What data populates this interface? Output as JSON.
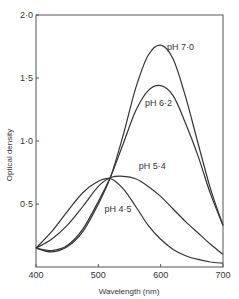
{
  "chart_data": {
    "type": "line",
    "title": "",
    "xlabel": "Wavelength (nm)",
    "ylabel": "Optical density",
    "xlim": [
      400,
      700
    ],
    "ylim": [
      0,
      2.0
    ],
    "x_ticks": [
      400,
      500,
      600,
      700
    ],
    "x_tick_labels": [
      "400",
      "500",
      "600",
      "700"
    ],
    "y_ticks": [
      0.5,
      1.0,
      1.5,
      2.0
    ],
    "y_tick_labels": [
      "0·5",
      "1·0",
      "1·5",
      "2·0"
    ],
    "grid": false,
    "legend": "inline labels",
    "x": [
      400,
      425,
      450,
      475,
      500,
      520,
      540,
      560,
      580,
      600,
      620,
      640,
      660,
      680,
      700
    ],
    "series": [
      {
        "name": "pH 7·0",
        "label": "pH 7·0",
        "values": [
          0.15,
          0.12,
          0.16,
          0.28,
          0.5,
          0.72,
          1.05,
          1.42,
          1.68,
          1.76,
          1.65,
          1.35,
          0.98,
          0.62,
          0.33
        ]
      },
      {
        "name": "pH 6·2",
        "label": "pH 6·2",
        "values": [
          0.15,
          0.13,
          0.17,
          0.3,
          0.52,
          0.72,
          0.98,
          1.24,
          1.4,
          1.44,
          1.36,
          1.14,
          0.88,
          0.58,
          0.33
        ]
      },
      {
        "name": "pH 5·4",
        "label": "pH 5·4",
        "values": [
          0.15,
          0.22,
          0.33,
          0.48,
          0.64,
          0.71,
          0.72,
          0.7,
          0.64,
          0.56,
          0.46,
          0.36,
          0.27,
          0.18,
          0.1
        ]
      },
      {
        "name": "pH 4·5",
        "label": "pH 4·5",
        "values": [
          0.15,
          0.28,
          0.44,
          0.59,
          0.68,
          0.7,
          0.62,
          0.48,
          0.33,
          0.22,
          0.14,
          0.09,
          0.06,
          0.04,
          0.03
        ]
      }
    ],
    "label_positions": {
      "pH 7·0": [
        610,
        1.72
      ],
      "pH 6·2": [
        575,
        1.28
      ],
      "pH 5·4": [
        565,
        0.78
      ],
      "pH 4·5": [
        510,
        0.44
      ]
    }
  },
  "colors": {
    "line": "#333333",
    "axis": "#555555",
    "background": "#ffffff"
  }
}
